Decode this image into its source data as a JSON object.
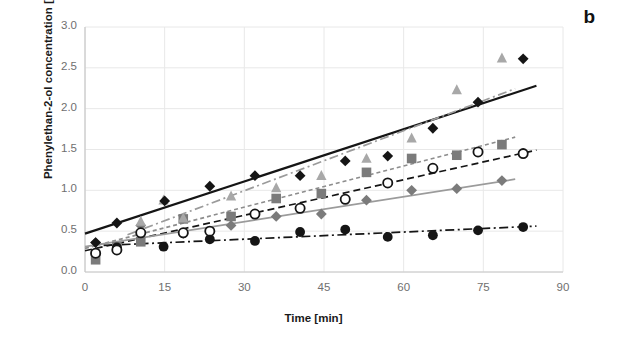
{
  "panel": {
    "label": "b"
  },
  "axes": {
    "xlabel": "Time [min]",
    "ylabel": "Phenylethan-2-ol concentration [ppbv]",
    "xticks": [
      "0",
      "15",
      "30",
      "45",
      "60",
      "75",
      "90"
    ],
    "yticks": [
      "0.0",
      "0.5",
      "1.0",
      "1.5",
      "2.0",
      "2.5",
      "3.0"
    ]
  },
  "colors": {
    "black": "#151515",
    "gray_marker": "#7b7b7b",
    "gray_light": "#a8a8a8",
    "gray_line": "#8d8d8d",
    "tick_text": "#6f6f6f",
    "grid": "#e8e8e8",
    "axis": "#c8c8c8",
    "background": "#ffffff"
  },
  "chart_data": {
    "type": "scatter",
    "title": "",
    "xlabel": "Time [min]",
    "ylabel": "Phenylethan-2-ol concentration [ppbv]",
    "xlim": [
      0,
      90
    ],
    "ylim": [
      0,
      3.0
    ],
    "xticks": [
      0,
      15,
      30,
      45,
      60,
      75,
      90
    ],
    "yticks": [
      0.0,
      0.5,
      1.0,
      1.5,
      2.0,
      2.5,
      3.0
    ],
    "grid": true,
    "legend": "none",
    "series": [
      {
        "name": "series-black-diamond",
        "marker": "diamond-filled",
        "color": "#151515",
        "line_style": "solid",
        "line_color": "#151515",
        "trend": {
          "intercept": 0.47,
          "slope": 0.0213
        },
        "points": [
          {
            "x": 2,
            "y": 0.36
          },
          {
            "x": 6,
            "y": 0.6
          },
          {
            "x": 15,
            "y": 0.87
          },
          {
            "x": 23.5,
            "y": 1.05
          },
          {
            "x": 32,
            "y": 1.18
          },
          {
            "x": 40.5,
            "y": 1.18
          },
          {
            "x": 49,
            "y": 1.36
          },
          {
            "x": 57,
            "y": 1.42
          },
          {
            "x": 65.5,
            "y": 1.76
          },
          {
            "x": 74,
            "y": 2.08
          },
          {
            "x": 82.5,
            "y": 2.61
          }
        ]
      },
      {
        "name": "series-gray-triangle",
        "marker": "triangle-filled",
        "color": "#a8a8a8",
        "line_style": "dash-dot",
        "line_color": "#9b9b9b",
        "trend": {
          "intercept": 0.26,
          "slope": 0.0245
        },
        "points": [
          {
            "x": 10.5,
            "y": 0.62
          },
          {
            "x": 14.8,
            "y": 0.88
          },
          {
            "x": 18.5,
            "y": 0.66
          },
          {
            "x": 27.5,
            "y": 0.93
          },
          {
            "x": 36,
            "y": 1.03
          },
          {
            "x": 44.5,
            "y": 1.18
          },
          {
            "x": 53,
            "y": 1.39
          },
          {
            "x": 61.5,
            "y": 1.64
          },
          {
            "x": 70,
            "y": 2.23
          },
          {
            "x": 78.5,
            "y": 2.62
          }
        ]
      },
      {
        "name": "series-gray-square",
        "marker": "square-filled",
        "color": "#7b7b7b",
        "line_style": "short-dash",
        "line_color": "#8d8d8d",
        "trend": {
          "intercept": 0.29,
          "slope": 0.0168
        },
        "points": [
          {
            "x": 2,
            "y": 0.15
          },
          {
            "x": 6,
            "y": 0.31
          },
          {
            "x": 10.5,
            "y": 0.37
          },
          {
            "x": 18.5,
            "y": 0.65
          },
          {
            "x": 27.5,
            "y": 0.68
          },
          {
            "x": 36,
            "y": 0.9
          },
          {
            "x": 44.5,
            "y": 0.96
          },
          {
            "x": 53,
            "y": 1.22
          },
          {
            "x": 61.5,
            "y": 1.39
          },
          {
            "x": 70,
            "y": 1.43
          },
          {
            "x": 78.5,
            "y": 1.56
          }
        ]
      },
      {
        "name": "series-open-circle",
        "marker": "circle-open",
        "color": "#151515",
        "line_style": "dash",
        "line_color": "#151515",
        "trend": {
          "intercept": 0.26,
          "slope": 0.0145
        },
        "points": [
          {
            "x": 2,
            "y": 0.23
          },
          {
            "x": 6,
            "y": 0.27
          },
          {
            "x": 10.5,
            "y": 0.48
          },
          {
            "x": 18.5,
            "y": 0.48
          },
          {
            "x": 23.5,
            "y": 0.5
          },
          {
            "x": 32,
            "y": 0.71
          },
          {
            "x": 40.5,
            "y": 0.78
          },
          {
            "x": 49,
            "y": 0.89
          },
          {
            "x": 57,
            "y": 1.09
          },
          {
            "x": 65.5,
            "y": 1.27
          },
          {
            "x": 74,
            "y": 1.47
          },
          {
            "x": 82.5,
            "y": 1.45
          }
        ]
      },
      {
        "name": "series-gray-diamond",
        "marker": "diamond-filled-gray",
        "color": "#7b7b7b",
        "line_style": "solid",
        "line_color": "#9b9b9b",
        "trend": {
          "intercept": 0.31,
          "slope": 0.0102
        },
        "points": [
          {
            "x": 2,
            "y": 0.36
          },
          {
            "x": 10.5,
            "y": 0.57
          },
          {
            "x": 18.5,
            "y": 0.47
          },
          {
            "x": 27.5,
            "y": 0.57
          },
          {
            "x": 36,
            "y": 0.68
          },
          {
            "x": 44.5,
            "y": 0.71
          },
          {
            "x": 53,
            "y": 0.88
          },
          {
            "x": 61.5,
            "y": 1.0
          },
          {
            "x": 70,
            "y": 1.02
          },
          {
            "x": 78.5,
            "y": 1.12
          }
        ]
      },
      {
        "name": "series-black-circle",
        "marker": "circle-filled",
        "color": "#151515",
        "line_style": "dash-dot",
        "line_color": "#151515",
        "trend": {
          "intercept": 0.315,
          "slope": 0.0029
        },
        "points": [
          {
            "x": 6,
            "y": 0.3
          },
          {
            "x": 14.8,
            "y": 0.31
          },
          {
            "x": 23.5,
            "y": 0.4
          },
          {
            "x": 32,
            "y": 0.38
          },
          {
            "x": 40.5,
            "y": 0.49
          },
          {
            "x": 49,
            "y": 0.52
          },
          {
            "x": 57,
            "y": 0.43
          },
          {
            "x": 65.5,
            "y": 0.45
          },
          {
            "x": 74,
            "y": 0.51
          },
          {
            "x": 82.5,
            "y": 0.55
          }
        ]
      }
    ]
  }
}
